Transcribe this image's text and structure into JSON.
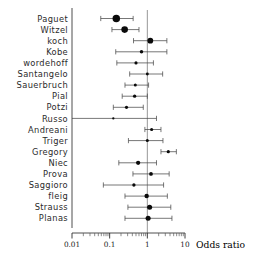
{
  "chart_data": {
    "type": "scatter",
    "subtype": "forest-plot",
    "title": "",
    "xlabel": "Odds ratio",
    "ylabel": "",
    "xscale": "log",
    "xlim": [
      0.01,
      10
    ],
    "grid": false,
    "legend": null,
    "reference_line": 1,
    "tick_labels": [
      "0.01",
      "0.1",
      "1",
      "10"
    ],
    "tick_values": [
      0.01,
      0.1,
      1,
      10
    ],
    "axis_title": "Odds ratio",
    "categories": [
      "Paguet",
      "Witzel",
      "koch",
      "Kobe",
      "wordehoff",
      "Santangelo",
      "Sauerbruch",
      "Pial",
      "Potzi",
      "Russo",
      "Andreani",
      "Triger",
      "Gregory",
      "Niec",
      "Prova",
      "Saggioro",
      "fleig",
      "Strauss",
      "Planas"
    ],
    "studies": [
      {
        "name": "Paguet",
        "or": 0.15,
        "lower": 0.058,
        "upper": 0.42,
        "weight": 5.2
      },
      {
        "name": "Witzel",
        "or": 0.25,
        "lower": 0.115,
        "upper": 0.6,
        "weight": 4.6
      },
      {
        "name": "koch",
        "or": 1.2,
        "lower": 0.43,
        "upper": 3.3,
        "weight": 4.0
      },
      {
        "name": "Kobe",
        "or": 0.7,
        "lower": 0.145,
        "upper": 3.3,
        "weight": 2.4
      },
      {
        "name": "wordehoff",
        "or": 0.5,
        "lower": 0.155,
        "upper": 1.45,
        "weight": 2.2
      },
      {
        "name": "Santangelo",
        "or": 1.0,
        "lower": 0.34,
        "upper": 2.55,
        "weight": 2.0
      },
      {
        "name": "Sauerbruch",
        "or": 0.48,
        "lower": 0.255,
        "upper": 1.08,
        "weight": 2.1
      },
      {
        "name": "Pial",
        "or": 0.46,
        "lower": 0.215,
        "upper": 1.0,
        "weight": 2.3
      },
      {
        "name": "Potzi",
        "or": 0.28,
        "lower": 0.125,
        "upper": 0.78,
        "weight": 2.2
      },
      {
        "name": "Russo",
        "or": 0.125,
        "lower": 0.01,
        "upper": 1.75,
        "weight": 1.5
      },
      {
        "name": "Andreani",
        "or": 1.3,
        "lower": 0.86,
        "upper": 2.3,
        "weight": 2.2
      },
      {
        "name": "Triger",
        "or": 1.0,
        "lower": 0.315,
        "upper": 2.6,
        "weight": 2.1
      },
      {
        "name": "Gregory",
        "or": 3.6,
        "lower": 2.3,
        "upper": 5.9,
        "weight": 2.2
      },
      {
        "name": "Niec",
        "or": 0.57,
        "lower": 0.175,
        "upper": 1.75,
        "weight": 3.0
      },
      {
        "name": "Prova",
        "or": 1.25,
        "lower": 0.415,
        "upper": 3.8,
        "weight": 2.6
      },
      {
        "name": "Saggioro",
        "or": 0.44,
        "lower": 0.068,
        "upper": 2.7,
        "weight": 2.3
      },
      {
        "name": "fleig",
        "or": 0.96,
        "lower": 0.255,
        "upper": 3.4,
        "weight": 3.1
      },
      {
        "name": "Strauss",
        "or": 1.15,
        "lower": 0.305,
        "upper": 4.2,
        "weight": 3.5
      },
      {
        "name": "Planas",
        "or": 1.05,
        "lower": 0.255,
        "upper": 4.5,
        "weight": 3.5
      }
    ]
  },
  "colors": {
    "marker": "#0a0a0a",
    "ci": "#4a4a4a",
    "axis": "#3a3a3a",
    "reference": "#8c8c8c",
    "label": "#2b2b2b",
    "background": "#ffffff"
  }
}
